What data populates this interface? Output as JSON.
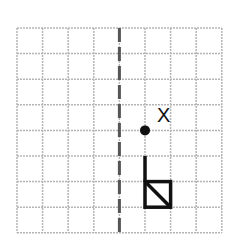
{
  "diagram": {
    "grid": {
      "cols": 8,
      "rows": 8,
      "left": 17,
      "top": 28,
      "cell": 25.6,
      "line_color": "#b5b5b5"
    },
    "mirror_line": {
      "type": "dashed-vertical",
      "col": 4,
      "color": "#555555"
    },
    "point": {
      "label": "X",
      "col": 5,
      "row": 4
    },
    "shape": {
      "description": "flag: vertical stem with square containing a diagonal",
      "stem": {
        "col": 5,
        "row_start": 5,
        "row_end": 6
      },
      "square": {
        "col": 5,
        "row": 6,
        "diagonal": "top-left to bottom-right"
      }
    }
  }
}
